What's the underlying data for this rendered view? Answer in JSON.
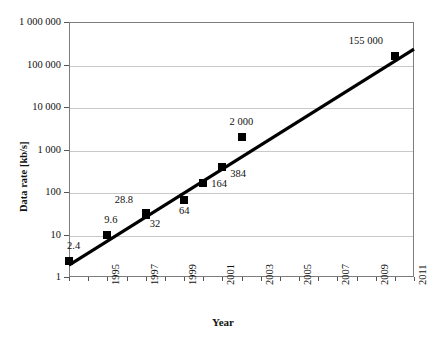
{
  "chart_data": {
    "type": "scatter",
    "title": "",
    "xlabel": "Year",
    "ylabel": "Data rate [kb/s]",
    "yscale": "log",
    "ylim": [
      1,
      1000000
    ],
    "xlim": [
      1993,
      2011
    ],
    "grid": true,
    "legend": "none",
    "y_tick_labels": [
      "1 000 000",
      "100 000",
      "10 000",
      "1 000",
      "100",
      "10",
      "1"
    ],
    "y_tick_values": [
      1000000,
      100000,
      10000,
      1000,
      100,
      10,
      1
    ],
    "x_tick_labels": [
      "1995",
      "1997",
      "1999",
      "2001",
      "2003",
      "2005",
      "2007",
      "2009",
      "2011"
    ],
    "x_tick_values": [
      1995,
      1997,
      1999,
      2001,
      2003,
      2005,
      2007,
      2009,
      2011
    ],
    "points": [
      {
        "x": 1993,
        "y": 2.4,
        "label": "2.4",
        "lx": -2,
        "ly": -20
      },
      {
        "x": 1995,
        "y": 9.6,
        "label": "9.6",
        "lx": -3,
        "ly": -20
      },
      {
        "x": 1997,
        "y": 32,
        "label": "28.8",
        "lx": -31,
        "ly": -18
      },
      {
        "x": 1997,
        "y": 28.8,
        "label": "32",
        "lx": 4,
        "ly": 4
      },
      {
        "x": 1999,
        "y": 64,
        "label": "64",
        "lx": -5,
        "ly": 6
      },
      {
        "x": 2000,
        "y": 164,
        "label": "164",
        "lx": 8,
        "ly": -4
      },
      {
        "x": 2001,
        "y": 384,
        "label": "384",
        "lx": 8,
        "ly": 2
      },
      {
        "x": 2002,
        "y": 2000,
        "label": "2 000",
        "lx": -12,
        "ly": -20
      },
      {
        "x": 2010,
        "y": 155000,
        "label": "155 000",
        "lx": -46,
        "ly": -20
      }
    ],
    "trendline": {
      "description": "straight fit on log scale",
      "x_start": 1993,
      "y_start": 1.9,
      "x_end": 2011,
      "y_end": 230000
    },
    "marker_style": "filled-square",
    "colors": {
      "marker": "#000000",
      "trendline": "#000000",
      "grid": "#c9c9c9",
      "frame": "#7d7d7d"
    }
  }
}
